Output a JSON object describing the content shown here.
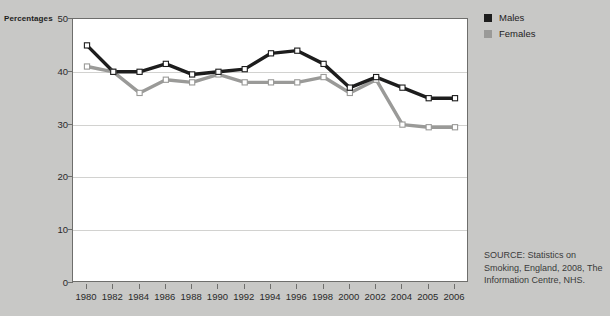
{
  "legend": {
    "position": "top-right",
    "entries": [
      {
        "label": "Males",
        "color": "#1d1d1d"
      },
      {
        "label": "Females",
        "color": "#9a9a98"
      }
    ]
  },
  "source": {
    "text": "SOURCE: Statistics on Smoking, England, 2008, The Information Centre, NHS."
  },
  "chart_data": {
    "type": "line",
    "title": "",
    "subtitle": "",
    "xlabel": "",
    "ylabel": "Percentages",
    "ylim": [
      0,
      50
    ],
    "yticks": [
      0,
      10,
      20,
      30,
      40,
      50
    ],
    "grid": true,
    "markers": "square-open",
    "categories": [
      "1980",
      "1982",
      "1984",
      "1986",
      "1988",
      "1990",
      "1992",
      "1994",
      "1996",
      "1998",
      "2000",
      "2002",
      "2004",
      "2005",
      "2006"
    ],
    "series": [
      {
        "name": "Males",
        "color": "#1d1d1d",
        "values": [
          45,
          40,
          40,
          41.5,
          39.5,
          40,
          40.5,
          43.5,
          44,
          41.5,
          37,
          39,
          37,
          35,
          35
        ]
      },
      {
        "name": "Females",
        "color": "#9a9a98",
        "values": [
          41,
          40,
          36,
          38.5,
          38,
          39.5,
          38,
          38,
          38,
          39,
          36,
          38.5,
          30,
          29.5,
          29.5
        ]
      }
    ]
  }
}
